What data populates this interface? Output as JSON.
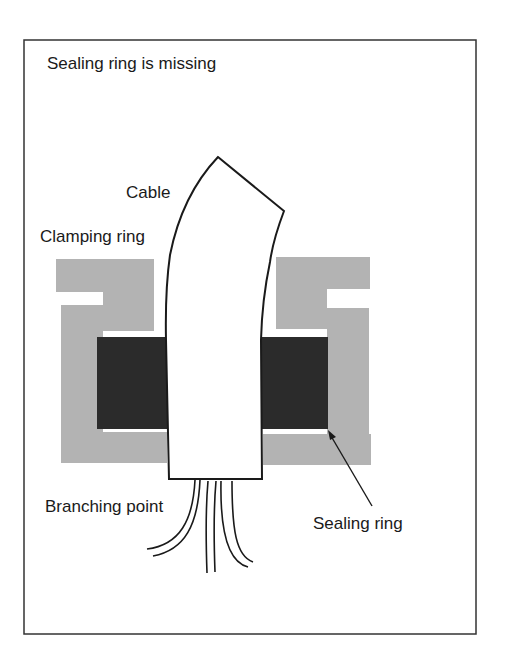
{
  "diagram": {
    "title": "Sealing ring is missing",
    "labels": {
      "cable": "Cable",
      "clamping_ring": "Clamping ring",
      "branching_point": "Branching point",
      "sealing_ring": "Sealing ring"
    },
    "colors": {
      "frame": "#333333",
      "clamping_ring_fill": "#b3b3b3",
      "sealing_ring_fill": "#2b2b2b",
      "cable_fill": "#ffffff",
      "line": "#1a1a1a"
    }
  }
}
